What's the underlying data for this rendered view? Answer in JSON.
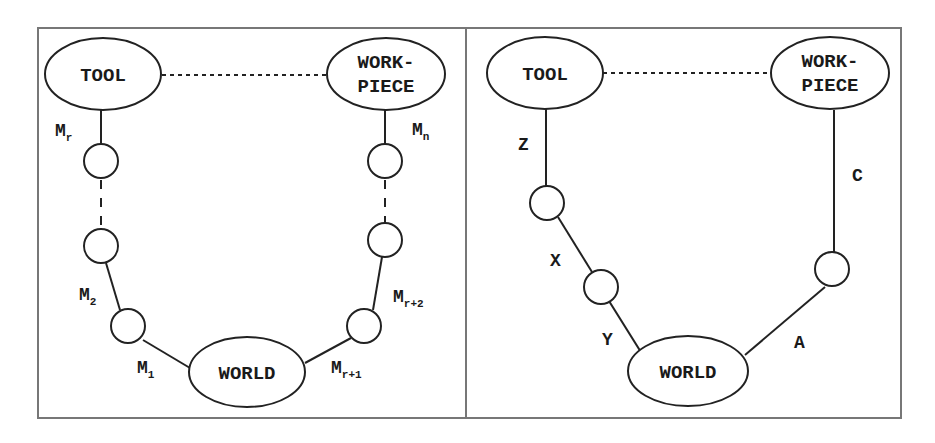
{
  "left_panel": {
    "nodes": {
      "tool": "TOOL",
      "workpiece_line1": "WORK-",
      "workpiece_line2": "PIECE",
      "world": "WORLD"
    },
    "edge_labels": {
      "mr": {
        "base": "M",
        "sub": "r"
      },
      "m2": {
        "base": "M",
        "sub": "2"
      },
      "m1": {
        "base": "M",
        "sub": "1"
      },
      "mn": {
        "base": "M",
        "sub": "n"
      },
      "mr2": {
        "base": "M",
        "sub": "r+2"
      },
      "mr1": {
        "base": "M",
        "sub": "r+1"
      }
    }
  },
  "right_panel": {
    "nodes": {
      "tool": "TOOL",
      "workpiece_line1": "WORK-",
      "workpiece_line2": "PIECE",
      "world": "WORLD"
    },
    "edge_labels": {
      "z": "Z",
      "x": "X",
      "y": "Y",
      "c": "C",
      "a": "A"
    }
  }
}
